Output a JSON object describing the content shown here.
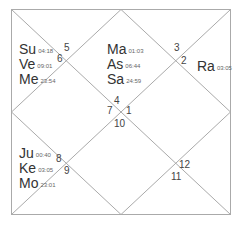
{
  "chart": {
    "style": "North Indian",
    "line_color": "#aaaaaa",
    "houses": [
      {
        "number": "1"
      },
      {
        "number": "2"
      },
      {
        "number": "3"
      },
      {
        "number": "4"
      },
      {
        "number": "5"
      },
      {
        "number": "6"
      },
      {
        "number": "7"
      },
      {
        "number": "8"
      },
      {
        "number": "9"
      },
      {
        "number": "10"
      },
      {
        "number": "11"
      },
      {
        "number": "12"
      }
    ],
    "planet_groups": {
      "top_center": [
        {
          "name": "Ma",
          "degree": "01:03"
        },
        {
          "name": "As",
          "degree": "06:44"
        },
        {
          "name": "Sa",
          "degree": "24:59"
        }
      ],
      "top_left": [
        {
          "name": "Su",
          "degree": "04:18"
        },
        {
          "name": "Ve",
          "degree": "09:01"
        },
        {
          "name": "Me",
          "degree": "23:54"
        }
      ],
      "right": [
        {
          "name": "Ra",
          "degree": "03:05"
        }
      ],
      "bottom_left": [
        {
          "name": "Ju",
          "degree": "00:40"
        },
        {
          "name": "Ke",
          "degree": "03:05"
        },
        {
          "name": "Mo",
          "degree": "23:01"
        }
      ]
    }
  }
}
